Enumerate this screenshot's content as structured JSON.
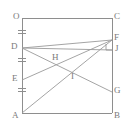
{
  "figure": {
    "canvas": {
      "width": 128,
      "height": 132
    },
    "stroke_color": "#8e8e8e",
    "chord_color": "#9a9a9a",
    "label_color": "#7a7a7a",
    "background": "#ffffff"
  },
  "labels": {
    "O": "O",
    "C": "C",
    "D": "D",
    "F": "F",
    "J": "J",
    "E": "E",
    "H": "H",
    "I": "I",
    "G": "G",
    "A": "A",
    "B": "B"
  },
  "points": [
    {
      "name": "O",
      "label": "O",
      "x": 22,
      "y": 18,
      "label_x": 13,
      "label_y": 12
    },
    {
      "name": "C",
      "label": "C",
      "x": 112,
      "y": 18,
      "label_x": 114,
      "label_y": 12
    },
    {
      "name": "D",
      "label": "D",
      "x": 22,
      "y": 48,
      "label_x": 11,
      "label_y": 43
    },
    {
      "name": "F",
      "label": "F",
      "x": 112,
      "y": 40,
      "label_x": 114,
      "label_y": 34
    },
    {
      "name": "J",
      "label": "J",
      "x": 112,
      "y": 50,
      "label_x": 115,
      "label_y": 45
    },
    {
      "name": "E",
      "label": "E",
      "x": 22,
      "y": 80,
      "label_x": 12,
      "label_y": 75
    },
    {
      "name": "H",
      "label": "H",
      "x": 56,
      "y": 61,
      "label_x": 52,
      "label_y": 54
    },
    {
      "name": "I",
      "label": "I",
      "x": 73,
      "y": 79,
      "label_x": 71,
      "label_y": 73
    },
    {
      "name": "G",
      "label": "G",
      "x": 112,
      "y": 92,
      "label_x": 114,
      "label_y": 87
    },
    {
      "name": "A",
      "label": "A",
      "x": 22,
      "y": 113,
      "label_x": 12,
      "label_y": 112
    },
    {
      "name": "B",
      "label": "B",
      "x": 112,
      "y": 113,
      "label_x": 114,
      "label_y": 112
    }
  ],
  "edges": [
    {
      "name": "edge-OC",
      "from": "O",
      "to": "C"
    },
    {
      "name": "edge-OA",
      "from": "O",
      "to": "A"
    },
    {
      "name": "edge-CB",
      "from": "C",
      "to": "B"
    },
    {
      "name": "edge-AB",
      "from": "A",
      "to": "B"
    }
  ],
  "segments": [
    {
      "name": "segment-DF",
      "from": "D",
      "to": "F"
    },
    {
      "name": "segment-DJ",
      "from": "D",
      "to": "J"
    },
    {
      "name": "segment-DG",
      "from": "D",
      "to": "G"
    },
    {
      "name": "segment-EF",
      "from": "E",
      "to": "F"
    },
    {
      "name": "segment-AF",
      "from": "A",
      "to": "F"
    }
  ],
  "tick_marks": {
    "name": "congruence-ticks-on-OA",
    "axis_x": 22,
    "positions_y": [
      30,
      33,
      58,
      61,
      88,
      91
    ],
    "half_width": 4
  },
  "right_angle_marker": {
    "name": "right-angle-at-J",
    "x": 112,
    "y": 50,
    "size": 6
  }
}
